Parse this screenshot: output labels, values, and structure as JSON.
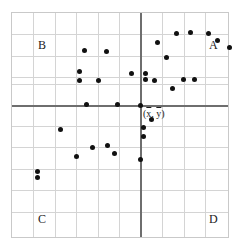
{
  "chart_data": {
    "type": "scatter",
    "title": "",
    "xlabel": "",
    "ylabel": "",
    "grid": true,
    "legend": "none",
    "xlim": [
      0,
      218
    ],
    "ylim": [
      0,
      226
    ],
    "axes": {
      "vertical_axis_x": 128,
      "horizontal_axis_y": 92,
      "axis_color": "#6e6e6e",
      "description": "Crosshair axes drawn through the centroid (x-bar, y-bar), dividing the grid into four quadrants."
    },
    "grid_spacing": 21,
    "point_color": "#111111",
    "point_count": 41,
    "points": [
      {
        "x": 164,
        "y": 20,
        "quadrant": "A"
      },
      {
        "x": 178,
        "y": 19,
        "quadrant": "A"
      },
      {
        "x": 196,
        "y": 20,
        "quadrant": "A"
      },
      {
        "x": 205,
        "y": 27,
        "quadrant": "A"
      },
      {
        "x": 217,
        "y": 34,
        "quadrant": "A"
      },
      {
        "x": 145,
        "y": 29,
        "quadrant": "A"
      },
      {
        "x": 154,
        "y": 44,
        "quadrant": "A"
      },
      {
        "x": 133,
        "y": 60,
        "quadrant": "A"
      },
      {
        "x": 133,
        "y": 66,
        "quadrant": "A"
      },
      {
        "x": 142,
        "y": 67,
        "quadrant": "A"
      },
      {
        "x": 171,
        "y": 66,
        "quadrant": "A"
      },
      {
        "x": 182,
        "y": 66,
        "quadrant": "A"
      },
      {
        "x": 160,
        "y": 75,
        "quadrant": "A"
      },
      {
        "x": 119,
        "y": 60,
        "quadrant": "B"
      },
      {
        "x": 94,
        "y": 38,
        "quadrant": "B"
      },
      {
        "x": 72,
        "y": 37,
        "quadrant": "B"
      },
      {
        "x": 67,
        "y": 58,
        "quadrant": "B"
      },
      {
        "x": 67,
        "y": 67,
        "quadrant": "B"
      },
      {
        "x": 86,
        "y": 67,
        "quadrant": "B"
      },
      {
        "x": 74,
        "y": 91,
        "quadrant": "B"
      },
      {
        "x": 105,
        "y": 91,
        "quadrant": "B"
      },
      {
        "x": 128,
        "y": 92,
        "quadrant": "center"
      },
      {
        "x": 139,
        "y": 106,
        "quadrant": "D"
      },
      {
        "x": 131,
        "y": 114,
        "quadrant": "D"
      },
      {
        "x": 131,
        "y": 123,
        "quadrant": "D"
      },
      {
        "x": 128,
        "y": 146,
        "quadrant": "D"
      },
      {
        "x": 48,
        "y": 116,
        "quadrant": "C"
      },
      {
        "x": 80,
        "y": 134,
        "quadrant": "C"
      },
      {
        "x": 95,
        "y": 132,
        "quadrant": "C"
      },
      {
        "x": 102,
        "y": 140,
        "quadrant": "C"
      },
      {
        "x": 64,
        "y": 143,
        "quadrant": "C"
      },
      {
        "x": 25,
        "y": 158,
        "quadrant": "C"
      },
      {
        "x": 25,
        "y": 164,
        "quadrant": "C"
      }
    ],
    "quadrant_labels": [
      {
        "label": "A",
        "corner": "top-right",
        "x": 197,
        "y": 26
      },
      {
        "label": "B",
        "corner": "top-left",
        "x": 26,
        "y": 26
      },
      {
        "label": "C",
        "corner": "bottom-left",
        "x": 26,
        "y": 200
      },
      {
        "label": "D",
        "corner": "bottom-right",
        "x": 197,
        "y": 200
      }
    ],
    "centroid_annotation": {
      "text": "(x̄, ȳ)",
      "x_symbol": "x",
      "y_symbol": "y",
      "x": 131,
      "y": 96
    }
  }
}
